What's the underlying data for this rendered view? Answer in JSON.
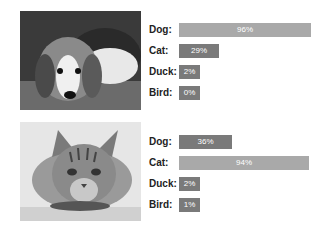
{
  "panels": [
    {
      "image": {
        "subject": "beagle puppy lying on carpet",
        "icon": "dog-photo"
      },
      "predictions": [
        {
          "label": "Dog:",
          "value": 96,
          "text": "96%"
        },
        {
          "label": "Cat:",
          "value": 29,
          "text": "29%"
        },
        {
          "label": "Duck:",
          "value": 2,
          "text": "2%"
        },
        {
          "label": "Bird:",
          "value": 0,
          "text": "0%"
        }
      ]
    },
    {
      "image": {
        "subject": "tabby cat lying down",
        "icon": "cat-photo"
      },
      "predictions": [
        {
          "label": "Dog:",
          "value": 36,
          "text": "36%"
        },
        {
          "label": "Cat:",
          "value": 94,
          "text": "94%"
        },
        {
          "label": "Duck:",
          "value": 2,
          "text": "2%"
        },
        {
          "label": "Bird:",
          "value": 1,
          "text": "1%"
        }
      ]
    }
  ],
  "colors": {
    "bar_top": "#a9a9a9",
    "bar_other": "#7a7a7a",
    "label": "#222222"
  }
}
